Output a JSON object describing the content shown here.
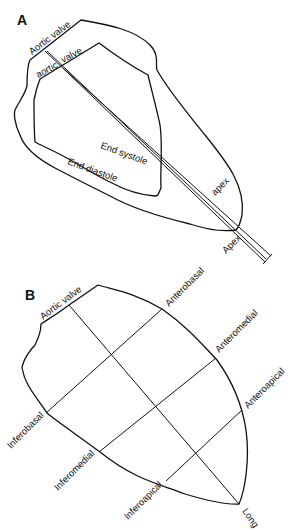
{
  "panel_a": {
    "label": "A",
    "labels": {
      "aortic_valve_outer": "Aortic valve",
      "aortic_valve_inner_1": "aortic",
      "aortic_valve_inner_2": "valve",
      "end_systole": "End systole",
      "end_diastole": "End diastole",
      "apex_inner": "apex",
      "apex_outer": "Apex"
    }
  },
  "panel_b": {
    "label": "B",
    "labels": {
      "aortic_valve": "Aortic valve",
      "anterobasal": "Anterobasal",
      "anteromedial": "Anteromedial",
      "anteroapical": "Anteroapical",
      "inferobasal": "Inferobasal",
      "inferomedial": "Inferomedial",
      "inferoapical": "Inferoapical",
      "long": "Long"
    }
  }
}
